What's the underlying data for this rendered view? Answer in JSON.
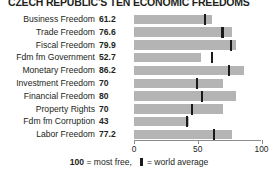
{
  "chart_data": {
    "type": "bar",
    "title": "CZECH REPUBLIC'S TEN ECONOMIC FREEDOMS",
    "xlabel": "",
    "ylabel": "",
    "xlim": [
      0,
      100
    ],
    "grid": false,
    "orientation": "horizontal",
    "tick_labels": [
      "0",
      "50",
      "100"
    ],
    "ticks": [
      0,
      50,
      100
    ],
    "categories": [
      "Business Freedom",
      "Trade Freedom",
      "Fiscal Freedom",
      "Fdm fm Government",
      "Monetary Freedom",
      "Investment Freedom",
      "Financial Freedom",
      "Property Rights",
      "Fdm fm Corruption",
      "Labor Freedom"
    ],
    "series": [
      {
        "name": "Czech Republic score",
        "values": [
          61.2,
          76.6,
          79.9,
          52.7,
          86.2,
          70,
          80,
          70,
          43,
          77.2
        ],
        "value_labels": [
          "61.2",
          "76.6",
          "79.9",
          "52.7",
          "86.2",
          "70",
          "80",
          "70",
          "43",
          "77.2"
        ]
      },
      {
        "name": "World average",
        "values": [
          55.0,
          68.5,
          75.5,
          60.5,
          73.5,
          48.5,
          52.5,
          44.5,
          40.5,
          62.0
        ]
      }
    ],
    "legend": {
      "position": "bottom",
      "max_label": "100",
      "max_text": "= most free,",
      "marker_text": "= world average"
    },
    "colors": {
      "bar": "#b4b4b4",
      "marker": "#1a1a1a",
      "axis": "#8c8c8c",
      "text": "#231f20",
      "background": "#ffffff"
    }
  }
}
